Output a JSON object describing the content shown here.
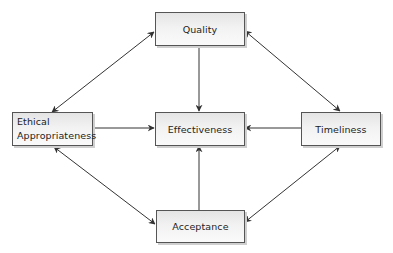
{
  "diagram": {
    "type": "flowchart",
    "nodes": {
      "quality": {
        "label": "Quality"
      },
      "ethical": {
        "line1": "Ethical",
        "line2": "Appropriateness"
      },
      "effectiveness": {
        "label": "Effectiveness"
      },
      "timeliness": {
        "label": "Timeliness"
      },
      "acceptance": {
        "label": "Acceptance"
      }
    },
    "edges": [
      {
        "from": "Quality",
        "to": "Effectiveness",
        "direction": "one-way"
      },
      {
        "from": "Ethical Appropriateness",
        "to": "Effectiveness",
        "direction": "one-way"
      },
      {
        "from": "Timeliness",
        "to": "Effectiveness",
        "direction": "one-way"
      },
      {
        "from": "Acceptance",
        "to": "Effectiveness",
        "direction": "one-way"
      },
      {
        "from": "Quality",
        "to": "Ethical Appropriateness",
        "direction": "two-way"
      },
      {
        "from": "Quality",
        "to": "Timeliness",
        "direction": "two-way"
      },
      {
        "from": "Ethical Appropriateness",
        "to": "Acceptance",
        "direction": "two-way"
      },
      {
        "from": "Timeliness",
        "to": "Acceptance",
        "direction": "two-way"
      }
    ],
    "colors": {
      "border": "#555555",
      "arrow": "#333333",
      "fill_top": "#e4e4e4",
      "fill_bottom": "#fafafa"
    }
  }
}
